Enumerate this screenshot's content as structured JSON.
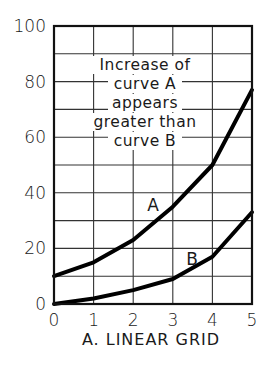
{
  "chart_data": {
    "type": "line",
    "title": "",
    "caption": "A. LINEAR GRID",
    "xlabel": "",
    "ylabel": "",
    "x": [
      0,
      1,
      2,
      3,
      4,
      5
    ],
    "xlim": [
      0,
      5
    ],
    "ylim": [
      0,
      100
    ],
    "x_ticks": [
      "0",
      "1",
      "2",
      "3",
      "4",
      "5"
    ],
    "y_ticks": [
      "0",
      "20",
      "40",
      "60",
      "80",
      "100"
    ],
    "grid": true,
    "grid_y_step": 10,
    "series": [
      {
        "name": "A",
        "values": [
          10,
          15,
          23,
          35,
          50,
          77
        ]
      },
      {
        "name": "B",
        "values": [
          0,
          2,
          5,
          9,
          17,
          33
        ]
      }
    ],
    "annotation": [
      "Increase of",
      "curve A",
      "appears",
      "greater than",
      "curve B"
    ]
  }
}
